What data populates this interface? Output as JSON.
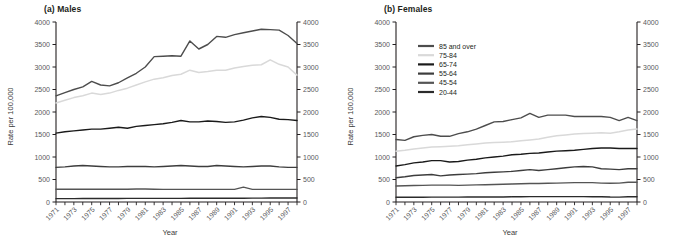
{
  "figure": {
    "panels": [
      {
        "id": "males",
        "title": "(a) Males",
        "xlabel": "Year",
        "ylabel": "Rate per 100,000"
      },
      {
        "id": "females",
        "title": "(b) Females",
        "xlabel": "Year",
        "ylabel": "Rate per 100,000"
      }
    ],
    "legend": {
      "position": "top-left-of-females-panel",
      "entries": [
        {
          "label": "85 and over",
          "color": "#4d4d4d"
        },
        {
          "label": "75-84",
          "color": "#d9d9d9"
        },
        {
          "label": "65-74",
          "color": "#1a1a1a"
        },
        {
          "label": "55-64",
          "color": "#3d3d3d"
        },
        {
          "label": "45-54",
          "color": "#555555"
        },
        {
          "label": "20-44",
          "color": "#2b2b2b"
        }
      ]
    },
    "axis": {
      "y_ticks": [
        "0",
        "500",
        "1000",
        "1500",
        "2000",
        "2500",
        "3000",
        "3500",
        "4000"
      ],
      "x_ticks": [
        "1971",
        "1973",
        "1975",
        "1977",
        "1979",
        "1981",
        "1983",
        "1985",
        "1987",
        "1989",
        "1991",
        "1993",
        "1995",
        "1997"
      ],
      "ylim": [
        0,
        4000
      ],
      "xlim": [
        1971,
        1998
      ]
    }
  },
  "chart_data": [
    {
      "type": "line",
      "title": "(a) Males",
      "xlabel": "Year",
      "ylabel": "Rate per 100,000",
      "ylim": [
        0,
        4000
      ],
      "xlim": [
        1971,
        1998
      ],
      "grid": false,
      "legend": "shared, shown in panel (b)",
      "x": [
        1971,
        1972,
        1973,
        1974,
        1975,
        1976,
        1977,
        1978,
        1979,
        1980,
        1981,
        1982,
        1983,
        1984,
        1985,
        1986,
        1987,
        1988,
        1989,
        1990,
        1991,
        1992,
        1993,
        1994,
        1995,
        1996,
        1997,
        1998
      ],
      "series": [
        {
          "name": "85 and over",
          "color": "#4d4d4d",
          "values": [
            2360,
            2430,
            2500,
            2560,
            2680,
            2600,
            2580,
            2650,
            2760,
            2860,
            3000,
            3230,
            3240,
            3250,
            3240,
            3580,
            3400,
            3500,
            3680,
            3660,
            3720,
            3760,
            3800,
            3840,
            3830,
            3820,
            3700,
            3520
          ]
        },
        {
          "name": "75-84",
          "color": "#d9d9d9",
          "values": [
            2200,
            2260,
            2320,
            2360,
            2420,
            2390,
            2420,
            2480,
            2530,
            2600,
            2670,
            2730,
            2760,
            2810,
            2840,
            2930,
            2880,
            2900,
            2930,
            2930,
            2980,
            3010,
            3040,
            3050,
            3160,
            3060,
            3000,
            2820
          ]
        },
        {
          "name": "65-74",
          "color": "#1a1a1a",
          "values": [
            1530,
            1560,
            1580,
            1600,
            1620,
            1620,
            1640,
            1660,
            1640,
            1680,
            1700,
            1720,
            1740,
            1770,
            1810,
            1780,
            1780,
            1800,
            1790,
            1770,
            1780,
            1820,
            1870,
            1900,
            1880,
            1840,
            1830,
            1810
          ]
        },
        {
          "name": "55-64",
          "color": "#3d3d3d",
          "values": [
            770,
            780,
            800,
            810,
            800,
            790,
            780,
            780,
            790,
            790,
            790,
            780,
            790,
            800,
            810,
            800,
            790,
            790,
            810,
            800,
            790,
            780,
            790,
            800,
            800,
            780,
            770,
            770
          ]
        },
        {
          "name": "45-54",
          "color": "#555555",
          "values": [
            285,
            285,
            285,
            285,
            285,
            285,
            285,
            285,
            285,
            290,
            290,
            285,
            280,
            280,
            280,
            280,
            280,
            280,
            280,
            280,
            280,
            330,
            280,
            280,
            280,
            280,
            280,
            280
          ]
        },
        {
          "name": "20-44",
          "color": "#2b2b2b",
          "values": [
            75,
            75,
            75,
            78,
            78,
            78,
            78,
            78,
            80,
            80,
            80,
            80,
            80,
            80,
            80,
            82,
            82,
            82,
            82,
            82,
            84,
            84,
            86,
            86,
            88,
            88,
            88,
            88
          ]
        }
      ]
    },
    {
      "type": "line",
      "title": "(b) Females",
      "xlabel": "Year",
      "ylabel": "Rate per 100,000",
      "ylim": [
        0,
        4000
      ],
      "xlim": [
        1971,
        1998
      ],
      "grid": false,
      "x": [
        1971,
        1972,
        1973,
        1974,
        1975,
        1976,
        1977,
        1978,
        1979,
        1980,
        1981,
        1982,
        1983,
        1984,
        1985,
        1986,
        1987,
        1988,
        1989,
        1990,
        1991,
        1992,
        1993,
        1994,
        1995,
        1996,
        1997,
        1998
      ],
      "series": [
        {
          "name": "85 and over",
          "color": "#4d4d4d",
          "values": [
            1390,
            1370,
            1450,
            1480,
            1500,
            1460,
            1460,
            1520,
            1560,
            1620,
            1700,
            1780,
            1790,
            1830,
            1870,
            1970,
            1880,
            1930,
            1930,
            1930,
            1900,
            1900,
            1900,
            1900,
            1880,
            1810,
            1880,
            1810
          ]
        },
        {
          "name": "75-84",
          "color": "#d9d9d9",
          "values": [
            1130,
            1150,
            1180,
            1200,
            1220,
            1230,
            1240,
            1250,
            1270,
            1290,
            1310,
            1320,
            1330,
            1340,
            1360,
            1380,
            1400,
            1440,
            1470,
            1490,
            1510,
            1520,
            1530,
            1540,
            1530,
            1560,
            1600,
            1620
          ]
        },
        {
          "name": "65-74",
          "color": "#1a1a1a",
          "values": [
            800,
            830,
            870,
            890,
            920,
            920,
            890,
            900,
            930,
            950,
            980,
            1000,
            1020,
            1050,
            1060,
            1080,
            1090,
            1110,
            1130,
            1140,
            1150,
            1170,
            1190,
            1200,
            1200,
            1190,
            1190,
            1190
          ]
        },
        {
          "name": "55-64",
          "color": "#3d3d3d",
          "values": [
            540,
            560,
            590,
            600,
            610,
            580,
            600,
            610,
            620,
            630,
            650,
            660,
            670,
            680,
            700,
            720,
            700,
            720,
            740,
            760,
            780,
            790,
            780,
            740,
            730,
            720,
            740,
            740
          ]
        },
        {
          "name": "45-54",
          "color": "#555555",
          "values": [
            355,
            360,
            365,
            370,
            375,
            375,
            375,
            370,
            375,
            380,
            385,
            390,
            395,
            400,
            405,
            410,
            410,
            415,
            420,
            425,
            430,
            430,
            430,
            420,
            415,
            420,
            440,
            440
          ]
        },
        {
          "name": "20-44",
          "color": "#2b2b2b",
          "values": [
            105,
            105,
            105,
            105,
            108,
            108,
            108,
            108,
            110,
            110,
            112,
            112,
            112,
            115,
            118,
            120,
            120,
            120,
            120,
            120,
            120,
            120,
            118,
            118,
            110,
            108,
            118,
            118
          ]
        }
      ]
    }
  ]
}
